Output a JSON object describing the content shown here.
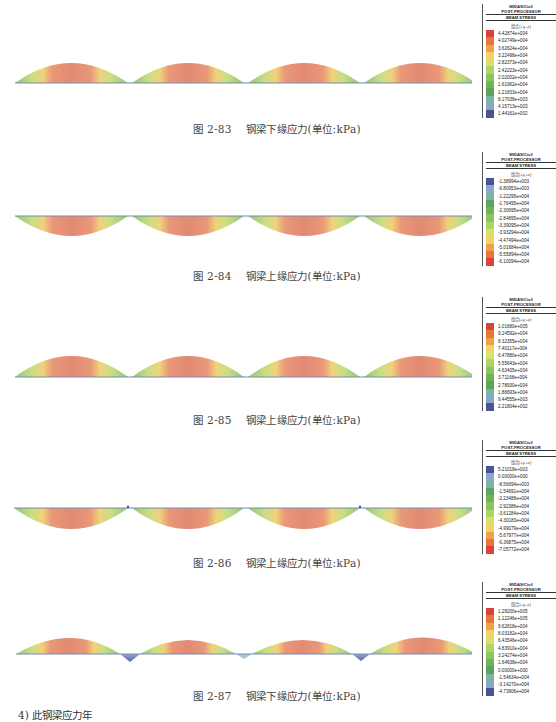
{
  "figures": [
    {
      "id": "2-83",
      "caption_num": "图 2-83",
      "caption_text": "钢梁下缘应力(单位:kPa)",
      "legend": {
        "title1": "MIDAS/Civil",
        "title2": "POST-PROCESSOR",
        "title3": "BEAM STRESS",
        "sub": "组合(+y,-z)",
        "values": [
          "4.42874e+004",
          "4.02749e+004",
          "3.62624e+004",
          "3.22498e+004",
          "2.82373e+004",
          "2.42223e+004",
          "2.02002e+004",
          "1.61962e+004",
          "1.21833e+004",
          "8.17038e+003",
          "4.15713e+003",
          "1.44161e+002"
        ]
      }
    },
    {
      "id": "2-84",
      "caption_num": "图 2-84",
      "caption_text": "钢梁上缘应力(单位:kPa)",
      "legend": {
        "title1": "MIDAS/Civil",
        "title2": "POST-PROCESSOR",
        "title3": "BEAM STRESS",
        "sub": "组合(+y,+z)",
        "values": [
          "-1.38994e+003",
          "-6.80953e+003",
          "-1.22295e+004",
          "-1.76495e+004",
          "-2.30695e+004",
          "-2.84895e+004",
          "-3.39095e+004",
          "-3.93294e+004",
          "-4.47494e+004",
          "-5.01684e+004",
          "-5.55894e+004",
          "-6.10094e+004"
        ]
      }
    },
    {
      "id": "2-85",
      "caption_num": "图 2-85",
      "caption_text": "钢梁上缘应力(单位:kPa)",
      "legend": {
        "title1": "MIDAS/Civil",
        "title2": "POST-PROCESSOR",
        "title3": "BEAM STRESS",
        "sub": "组合(+y,+z)",
        "values": [
          "1.01680e+005",
          "9.24592e+004",
          "8.32355e+004",
          "7.40117e+004",
          "6.47880e+004",
          "5.55643e+004",
          "4.63405e+004",
          "3.71168e+004",
          "2.78930e+004",
          "1.86693e+004",
          "9.44555e+003",
          "2.21804e+002"
        ]
      }
    },
    {
      "id": "2-86",
      "caption_num": "图 2-86",
      "caption_text": "钢梁上缘应力(单位:kPa)",
      "legend": {
        "title1": "MIDAS/Civil",
        "title2": "POST-PROCESSOR",
        "title3": "BEAM STRESS",
        "sub": "组合(+y,+z)",
        "values": [
          "5.21018e+003",
          "0.00000e+000",
          "-8.56694e+003",
          "-1.54691e+004",
          "-2.23488e+004",
          "-2.92386e+004",
          "-3.61284e+004",
          "-4.30183e+004",
          "-4.99079e+004",
          "-5.67977e+004",
          "-6.36875e+004",
          "-7.05772e+004"
        ]
      }
    },
    {
      "id": "2-87",
      "caption_num": "图 2-87",
      "caption_text": "钢梁下缘应力(单位:kPa)",
      "legend": {
        "title1": "MIDAS/Civil",
        "title2": "POST-PROCESSOR",
        "title3": "BEAM STRESS",
        "sub": "组合(+y,-z)",
        "values": [
          "1.28200e+005",
          "1.12246e+005",
          "9.62818e+004",
          "8.03182e+004",
          "6.43546e+004",
          "4.83910e+004",
          "3.24274e+004",
          "1.64638e+004",
          "0.00000e+000",
          "-1.54634e+004",
          "-3.14270e+004",
          "-4.73906e+004"
        ]
      }
    }
  ],
  "legend_colors_high_to_low": [
    "#d9443a",
    "#e8763a",
    "#efa24a",
    "#f1d36a",
    "#d8e16a",
    "#aed36a",
    "#8cc45e",
    "#6fb457",
    "#5ea35a",
    "#7bb5a8",
    "#8aa6c9",
    "#4a5394"
  ],
  "bottom_text": "4) 此钢梁应力年"
}
